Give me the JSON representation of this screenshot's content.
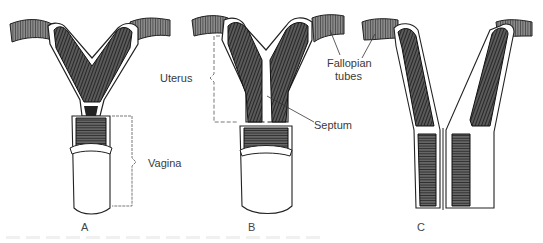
{
  "figure": {
    "panels": [
      {
        "id": "A",
        "letter": "A"
      },
      {
        "id": "B",
        "letter": "B"
      },
      {
        "id": "C",
        "letter": "C"
      }
    ],
    "labels": {
      "uterus": "Uterus",
      "vagina": "Vagina",
      "septum": "Septum",
      "fallopian_line1": "Fallopian",
      "fallopian_line2": "tubes"
    },
    "colors": {
      "ink": "#1a1a1a",
      "shade": "#3b3b3b",
      "background": "#ffffff",
      "label_text": "#3a3a3a"
    }
  }
}
